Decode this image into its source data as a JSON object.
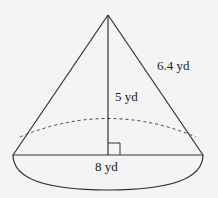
{
  "figure": {
    "type": "right circular cone",
    "labels": {
      "slant_height": "6.4 yd",
      "height": "5 yd",
      "diameter": "8 yd"
    },
    "colors": {
      "stroke": "#333333",
      "background": "#f4f4f4"
    }
  }
}
